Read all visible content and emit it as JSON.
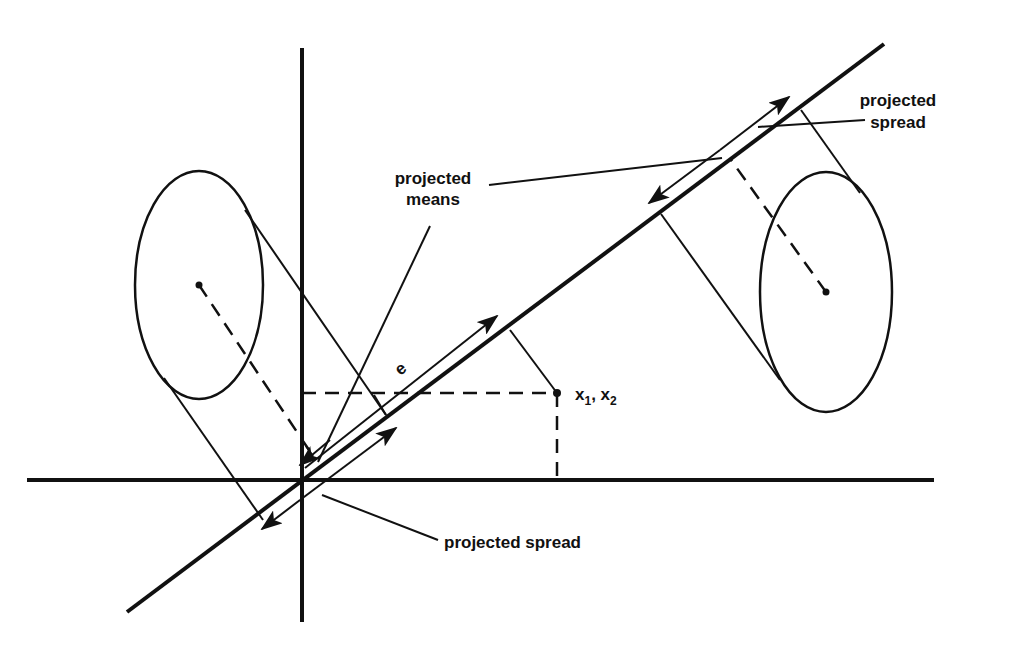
{
  "diagram": {
    "type": "linear discriminant projection",
    "colors": {
      "ink": "#111111",
      "background": "#ffffff"
    },
    "labels": {
      "projected_means": [
        "projected",
        "means"
      ],
      "projected_spread_top": [
        "projected",
        "spread"
      ],
      "projected_spread_bottom": "projected spread",
      "vector_e": "e",
      "point_label": {
        "x1": "x",
        "sub1": "1",
        "sep": ", ",
        "x2": "x",
        "sub2": "2"
      }
    },
    "elements": {
      "axes": {
        "horizontal": "x-axis",
        "vertical": "y-axis"
      },
      "projection_line": "direction e",
      "ellipses": [
        "left class distribution",
        "right class distribution"
      ],
      "point": "(x1, x2)"
    }
  }
}
